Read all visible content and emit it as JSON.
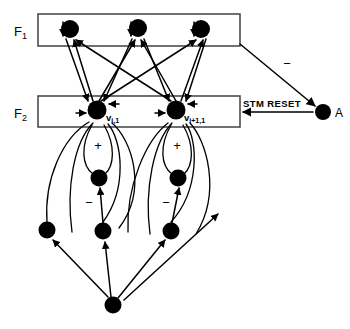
{
  "diagram": {
    "layers": [
      {
        "id": "F1",
        "label": "F",
        "subscript": "1",
        "x": 14,
        "y": 36
      },
      {
        "id": "F2",
        "label": "F",
        "subscript": "2",
        "x": 14,
        "y": 118
      }
    ],
    "boxes": [
      {
        "name": "f1-box",
        "x": 38,
        "y": 14,
        "w": 202,
        "h": 32
      },
      {
        "name": "f2-box",
        "x": 38,
        "y": 96,
        "w": 202,
        "h": 31
      }
    ],
    "f1_nodes": [
      {
        "name": "f1-node-1",
        "cx": 70,
        "cy": 29,
        "r": 9
      },
      {
        "name": "f1-node-2",
        "cx": 138,
        "cy": 28,
        "r": 9
      },
      {
        "name": "f1-node-3",
        "cx": 201,
        "cy": 29,
        "r": 9
      }
    ],
    "f2_nodes": [
      {
        "name": "f2-node-i",
        "cx": 97,
        "cy": 110,
        "r": 9.5,
        "label": "v",
        "sub": "i,1",
        "lx": 106,
        "ly": 121
      },
      {
        "name": "f2-node-i-plus-1",
        "cx": 176,
        "cy": 110,
        "r": 9.5,
        "label": "v",
        "sub": "i+1,1",
        "lx": 184,
        "ly": 121
      }
    ],
    "mid_nodes": [
      {
        "name": "mid-node-left",
        "cx": 99,
        "cy": 178,
        "r": 8.5
      },
      {
        "name": "mid-node-right",
        "cx": 178,
        "cy": 178,
        "r": 8.5
      }
    ],
    "lower_nodes": [
      {
        "name": "lower-node-left",
        "cx": 47,
        "cy": 230,
        "r": 8.5
      },
      {
        "name": "lower-node-center",
        "cx": 103,
        "cy": 231,
        "r": 8.5
      },
      {
        "name": "lower-node-right",
        "cx": 171,
        "cy": 231,
        "r": 8.5
      }
    ],
    "source_node": {
      "name": "input-source-node",
      "cx": 113,
      "cy": 305,
      "r": 8.5
    },
    "reset_node": {
      "name": "reset-node-a",
      "cx": 323,
      "cy": 112,
      "r": 8,
      "label": "A",
      "lx": 335,
      "ly": 117
    },
    "signs": [
      {
        "name": "plus-sign-left",
        "text": "+",
        "x": 98,
        "y": 150
      },
      {
        "name": "plus-sign-right",
        "text": "+",
        "x": 177,
        "y": 150
      },
      {
        "name": "minus-sign-left",
        "text": "−",
        "x": 89,
        "y": 207
      },
      {
        "name": "minus-sign-right",
        "text": "−",
        "x": 166,
        "y": 207
      },
      {
        "name": "minus-sign-reset",
        "text": "−",
        "x": 287,
        "y": 68
      }
    ],
    "stm_reset": {
      "name": "stm-reset-label",
      "text": "STM  RESET",
      "x": 243,
      "y": 107
    }
  }
}
